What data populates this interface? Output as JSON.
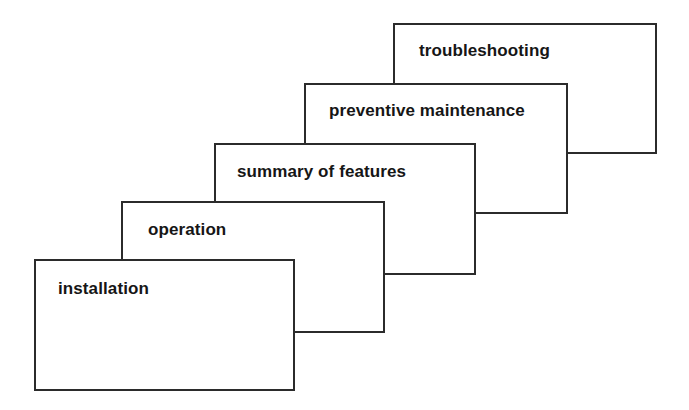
{
  "diagram": {
    "type": "cascading-stack",
    "title": "",
    "background_color": "#ffffff",
    "border_color": "#2b2b2b",
    "text_color": "#161616",
    "cards": [
      {
        "id": "troubleshooting",
        "label": "troubleshooting",
        "order": 5,
        "depth": "back"
      },
      {
        "id": "preventive-maintenance",
        "label": "preventive maintenance",
        "order": 4,
        "depth": "middle-back"
      },
      {
        "id": "summary-of-features",
        "label": "summary of features",
        "order": 3,
        "depth": "middle"
      },
      {
        "id": "operation",
        "label": "operation",
        "order": 2,
        "depth": "middle-front"
      },
      {
        "id": "installation",
        "label": "installation",
        "order": 1,
        "depth": "front"
      }
    ]
  }
}
